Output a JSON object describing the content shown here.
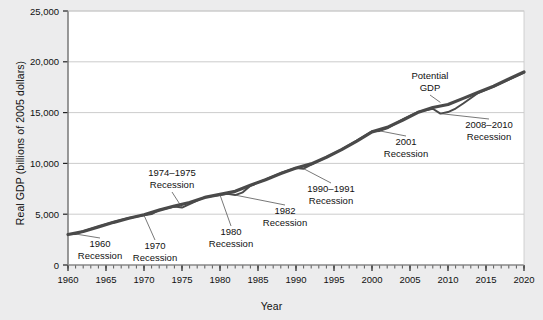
{
  "chart_data": {
    "type": "line",
    "title": "",
    "xlabel": "Year",
    "ylabel": "Real GDP (billions of 2005 dollars)",
    "xlim": [
      1960,
      2020
    ],
    "ylim": [
      0,
      25000
    ],
    "xticks": [
      1960,
      1965,
      1970,
      1975,
      1980,
      1985,
      1990,
      1995,
      2000,
      2005,
      2010,
      2015,
      2020
    ],
    "yticks": [
      0,
      5000,
      10000,
      15000,
      20000,
      25000
    ],
    "ytick_labels": [
      "0",
      "5,000",
      "10,000",
      "15,000",
      "20,000",
      "25,000"
    ],
    "xtick_labels": [
      "1960",
      "1965",
      "1970",
      "1975",
      "1980",
      "1985",
      "1990",
      "1995",
      "2000",
      "2005",
      "2010",
      "2015",
      "2020"
    ],
    "minor_xtick_interval": 1,
    "grid": "horizontal",
    "legend": "none",
    "line_color": "#4a4a4a",
    "background_color": "#ececed",
    "plot_background_color": "#ffffff",
    "series": [
      {
        "name": "Potential GDP",
        "x": [
          1960,
          1962,
          1964,
          1966,
          1968,
          1970,
          1972,
          1974,
          1976,
          1978,
          1980,
          1982,
          1984,
          1986,
          1988,
          1990,
          1992,
          1994,
          1996,
          1998,
          2000,
          2002,
          2004,
          2006,
          2008,
          2010,
          2012,
          2014,
          2016,
          2018,
          2020
        ],
        "values": [
          3000,
          3300,
          3750,
          4200,
          4600,
          4950,
          5400,
          5800,
          6150,
          6650,
          6950,
          7250,
          7850,
          8400,
          9000,
          9550,
          9950,
          10600,
          11350,
          12200,
          13100,
          13550,
          14250,
          15000,
          15500,
          15800,
          16400,
          17000,
          17600,
          18300,
          19000
        ]
      },
      {
        "name": "Actual Real GDP",
        "x": [
          1960,
          1961,
          1962,
          1964,
          1966,
          1968,
          1970,
          1971,
          1972,
          1974,
          1975,
          1976,
          1978,
          1980,
          1981,
          1982,
          1983,
          1984,
          1986,
          1988,
          1990,
          1991,
          1992,
          1994,
          1996,
          1998,
          2000,
          2001,
          2002,
          2004,
          2006,
          2008,
          2009,
          2010,
          2011,
          2012,
          2014,
          2016,
          2018,
          2020
        ],
        "values": [
          3020,
          3050,
          3320,
          3780,
          4230,
          4620,
          4900,
          5010,
          5420,
          5760,
          5650,
          6000,
          6680,
          6900,
          7000,
          6880,
          7150,
          7800,
          8420,
          9050,
          9550,
          9480,
          9870,
          10620,
          11380,
          12250,
          13150,
          13200,
          13450,
          14300,
          15050,
          15380,
          14900,
          15050,
          15400,
          15900,
          16950,
          17550,
          18250,
          18950
        ]
      }
    ],
    "annotations": [
      {
        "id": "recession-1960",
        "text_lines": [
          "1960",
          "Recession"
        ],
        "x": 1961,
        "value": 3050
      },
      {
        "id": "recession-1970",
        "text_lines": [
          "1970",
          "Recession"
        ],
        "x": 1970,
        "value": 4900
      },
      {
        "id": "recession-1974-1975",
        "text_lines": [
          "1974–1975",
          "Recession"
        ],
        "x": 1975,
        "value": 5650
      },
      {
        "id": "recession-1980",
        "text_lines": [
          "1980",
          "Recession"
        ],
        "x": 1980,
        "value": 6900
      },
      {
        "id": "recession-1982",
        "text_lines": [
          "1982",
          "Recession"
        ],
        "x": 1982,
        "value": 6880
      },
      {
        "id": "recession-1990-1991",
        "text_lines": [
          "1990–1991",
          "Recession"
        ],
        "x": 1991,
        "value": 9480
      },
      {
        "id": "recession-2001",
        "text_lines": [
          "2001",
          "Recession"
        ],
        "x": 2001,
        "value": 13200
      },
      {
        "id": "recession-2008-2010",
        "text_lines": [
          "2008–2010",
          "Recession"
        ],
        "x": 2009,
        "value": 14900
      },
      {
        "id": "potential-gdp",
        "text_lines": [
          "Potential",
          "GDP"
        ],
        "x": 2009,
        "value": 16000
      }
    ]
  }
}
